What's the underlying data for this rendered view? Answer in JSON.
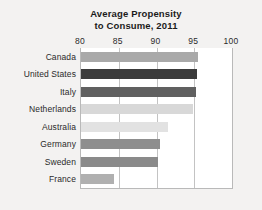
{
  "chart_data": {
    "type": "bar",
    "orientation": "horizontal",
    "title": "Average Propensity to Consume, 2011",
    "title_lines": [
      "Average Propensity",
      "to Consume, 2011"
    ],
    "xlabel": "",
    "ylabel": "",
    "xlim": [
      80,
      100
    ],
    "xticks": [
      80,
      85,
      90,
      95,
      100
    ],
    "xtick_labels": [
      "80",
      "85",
      "90",
      "95",
      "100"
    ],
    "grid": "vertical",
    "legend": "none",
    "categories": [
      "Canada",
      "United States",
      "Italy",
      "Netherlands",
      "Australia",
      "Germany",
      "Sweden",
      "France"
    ],
    "values": [
      95.5,
      95.4,
      95.2,
      94.8,
      91.5,
      90.5,
      90.2,
      84.4
    ],
    "bar_colors": [
      "#a9a9a9",
      "#3b3b3b",
      "#606060",
      "#d8d8d8",
      "#e2e2e2",
      "#8e8e8e",
      "#8a8a8a",
      "#b0b0b0"
    ]
  },
  "colors": {
    "background": "#f3f2f1",
    "plot_background": "#ffffff",
    "gridline": "#c3c3c3",
    "frame": "#b9b9b9",
    "text": "#2a2a2a",
    "title_text": "#1b1b1b"
  }
}
